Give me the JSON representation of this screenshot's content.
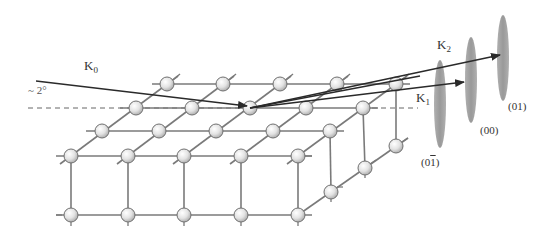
{
  "figure": {
    "incident_beam": {
      "label": "K",
      "subscript": "0",
      "angle_label": "~ 2°"
    },
    "diffracted_beams": [
      {
        "label": "K",
        "subscript": "2"
      },
      {
        "label": "K",
        "subscript": "1"
      }
    ],
    "streaks": [
      {
        "index_label": "(0",
        "index_bar": "1",
        "index_close": ")"
      },
      {
        "index_label": "(00)"
      },
      {
        "index_label": "(01)"
      }
    ],
    "colors": {
      "lattice_line": "#7a7a7a",
      "atom_fill_light": "#f4f4f4",
      "atom_fill_dark": "#bdbdbd",
      "atom_stroke": "#707070",
      "beam": "#2a2a2a",
      "streak": "#9e9e9e",
      "dashed_line": "#555555"
    }
  }
}
